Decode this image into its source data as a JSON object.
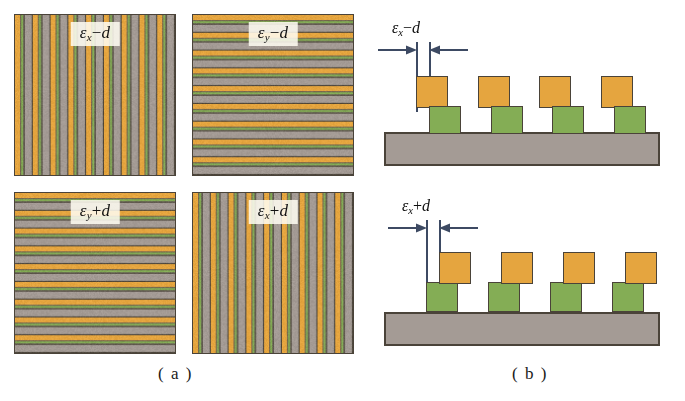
{
  "figure": {
    "background_color": "#ffffff",
    "width": 685,
    "height": 401
  },
  "colors": {
    "orange_layer": "#e5a53f",
    "green_layer": "#84ad55",
    "substrate_gray": "#a49b95",
    "outline_dark": "#4a4339",
    "dimension_line": "#3d4a63",
    "label_box_background": "#fffdf2"
  },
  "part_a": {
    "caption": "( a )",
    "description": "Top-view grating patterns",
    "panels": [
      {
        "id": "top-left",
        "label": "εx−d",
        "label_symbol": "ε",
        "label_subscript": "x",
        "label_operator": "−",
        "label_term": "d",
        "orientation": "vertical-stripes",
        "period_count": 9
      },
      {
        "id": "top-right",
        "label": "εy−d",
        "label_symbol": "ε",
        "label_subscript": "y",
        "label_operator": "−",
        "label_term": "d",
        "orientation": "horizontal-stripes",
        "period_count": 9
      },
      {
        "id": "bottom-left",
        "label": "εy+d",
        "label_symbol": "ε",
        "label_subscript": "y",
        "label_operator": "+",
        "label_term": "d",
        "orientation": "horizontal-stripes",
        "period_count": 9
      },
      {
        "id": "bottom-right",
        "label": "εx+d",
        "label_symbol": "ε",
        "label_subscript": "x",
        "label_operator": "+",
        "label_term": "d",
        "orientation": "vertical-stripes",
        "period_count": 9
      }
    ]
  },
  "part_b": {
    "caption": "( b )",
    "description": "Cross-section views of stacked layers on substrate",
    "diagrams": [
      {
        "id": "top",
        "label": "εx−d",
        "label_symbol": "ε",
        "label_subscript": "x",
        "label_operator": "−",
        "label_term": "d",
        "offset_direction": "left",
        "block_count": 4
      },
      {
        "id": "bottom",
        "label": "εx+d",
        "label_symbol": "ε",
        "label_subscript": "x",
        "label_operator": "+",
        "label_term": "d",
        "offset_direction": "right",
        "block_count": 4
      }
    ]
  }
}
